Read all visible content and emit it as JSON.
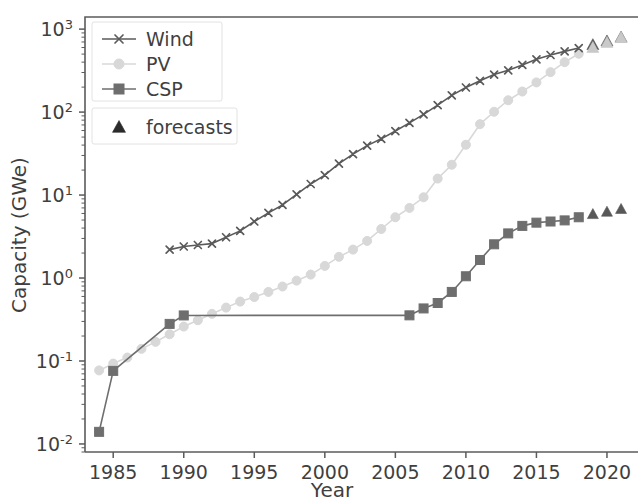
{
  "figure": {
    "background": "#ffffff",
    "width": 639,
    "height": 503
  },
  "chart_data": {
    "type": "line",
    "title": "",
    "xlabel": "Year",
    "ylabel": "Capacity (GWe)",
    "yscale": "log",
    "xscale": "linear",
    "xlim": [
      1983.0,
      2022.2
    ],
    "ylim": [
      0.008,
      1400
    ],
    "grid": false,
    "legend_position": "upper left",
    "xticks": [
      1985,
      1990,
      1995,
      2000,
      2005,
      2010,
      2015,
      2020
    ],
    "xticklabels": [
      "1985",
      "1990",
      "1995",
      "2000",
      "2005",
      "2010",
      "2015",
      "2020"
    ],
    "yticks": [
      0.01,
      0.1,
      1,
      10,
      100,
      1000
    ],
    "yticklabels": [
      "10^-2",
      "10^-1",
      "10^0",
      "10^1",
      "10^2",
      "10^3"
    ],
    "ytick_bases": [
      "10",
      "10",
      "10",
      "10",
      "10",
      "10"
    ],
    "ytick_exponents": [
      "-2",
      "-1",
      "0",
      "1",
      "2",
      "3"
    ],
    "legend_entries": [
      {
        "label": "Wind",
        "marker": "x",
        "color": "#5a5a5a"
      },
      {
        "label": "PV",
        "marker": "o",
        "color": "#d8d8d8"
      },
      {
        "label": "CSP",
        "marker": "s",
        "color": "#6e6e6e"
      }
    ],
    "legend_forecast": {
      "label": "forecasts",
      "marker": "^",
      "color": "#2b2b2b"
    },
    "series": [
      {
        "name": "Wind",
        "marker": "x",
        "color": "#5a5a5a",
        "linewidth": 1.6,
        "markersize": 7,
        "x": [
          1989,
          1990,
          1991,
          1992,
          1993,
          1994,
          1995,
          1996,
          1997,
          1998,
          1999,
          2000,
          2001,
          2002,
          2003,
          2004,
          2005,
          2006,
          2007,
          2008,
          2009,
          2010,
          2011,
          2012,
          2013,
          2014,
          2015,
          2016,
          2017,
          2018
        ],
        "y": [
          2.2,
          2.4,
          2.5,
          2.6,
          3.1,
          3.7,
          4.8,
          6.1,
          7.6,
          10.2,
          13.6,
          17.4,
          23.9,
          31.1,
          39.4,
          47.6,
          59.1,
          74.1,
          93.9,
          121.2,
          159.1,
          197.9,
          238.1,
          283.1,
          318.6,
          369.9,
          432.7,
          487.7,
          539.1,
          591.0
        ]
      },
      {
        "name": "PV",
        "marker": "o",
        "color": "#d8d8d8",
        "linewidth": 1.6,
        "markersize": 9,
        "x": [
          1984,
          1985,
          1986,
          1987,
          1988,
          1989,
          1990,
          1991,
          1992,
          1993,
          1994,
          1995,
          1996,
          1997,
          1998,
          1999,
          2000,
          2001,
          2002,
          2003,
          2004,
          2005,
          2006,
          2007,
          2008,
          2009,
          2010,
          2011,
          2012,
          2013,
          2014,
          2015,
          2016,
          2017,
          2018
        ],
        "y": [
          0.077,
          0.093,
          0.11,
          0.14,
          0.17,
          0.21,
          0.26,
          0.31,
          0.37,
          0.44,
          0.52,
          0.59,
          0.68,
          0.79,
          0.93,
          1.1,
          1.4,
          1.8,
          2.2,
          2.8,
          3.9,
          5.4,
          7.0,
          9.4,
          15.8,
          23.2,
          40.4,
          71.5,
          100.9,
          138.9,
          177.0,
          228.0,
          303.0,
          400.0,
          505.0
        ]
      },
      {
        "name": "CSP",
        "marker": "s",
        "color": "#6e6e6e",
        "linewidth": 1.6,
        "markersize": 9,
        "x": [
          1984,
          1985,
          1989,
          1990,
          2006,
          2007,
          2008,
          2009,
          2010,
          2011,
          2012,
          2013,
          2014,
          2015,
          2016,
          2017,
          2018
        ],
        "y": [
          0.014,
          0.076,
          0.28,
          0.354,
          0.355,
          0.43,
          0.5,
          0.68,
          1.05,
          1.65,
          2.55,
          3.45,
          4.25,
          4.65,
          4.8,
          4.95,
          5.4
        ]
      }
    ],
    "forecasts": [
      {
        "name": "Wind forecasts",
        "marker": "^",
        "color": "#555555",
        "markersize": 12,
        "x": [
          2019,
          2020,
          2021
        ],
        "y": [
          650,
          720,
          800
        ]
      },
      {
        "name": "PV forecasts",
        "marker": "^",
        "color": "#c9c9c9",
        "markersize": 12,
        "x": [
          2019,
          2020,
          2021
        ],
        "y": [
          600,
          690,
          790
        ]
      },
      {
        "name": "CSP forecasts",
        "marker": "^",
        "color": "#585858",
        "markersize": 11,
        "x": [
          2019,
          2020,
          2021
        ],
        "y": [
          5.9,
          6.3,
          6.8
        ]
      }
    ]
  }
}
